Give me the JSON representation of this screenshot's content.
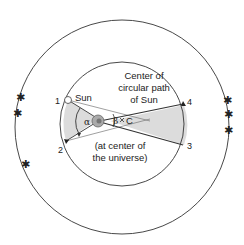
{
  "diagram": {
    "labels": {
      "sun": "Sun",
      "center_line1": "Center of",
      "center_line2": "circular path",
      "center_line3": "of Sun",
      "earth_line1": "(at center of",
      "earth_line2": "the universe)",
      "point_c": "C",
      "alpha": "α",
      "beta": "β",
      "pos1": "1",
      "pos2": "2",
      "pos3": "3",
      "pos4": "4"
    },
    "elements": {
      "outer_circle": "celestial sphere of fixed stars",
      "inner_circle": "circular path of Sun",
      "earth": "Earth at center of the universe",
      "stars_left": 3,
      "stars_right": 3
    },
    "colors": {
      "line": "#333333",
      "shade": "#dcdcdc",
      "earth": "#999999"
    }
  }
}
